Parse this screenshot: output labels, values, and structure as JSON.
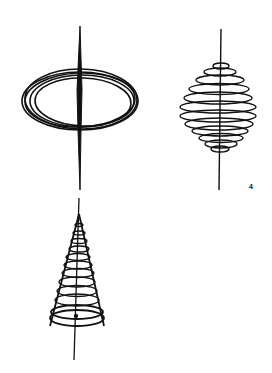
{
  "figure": {
    "label": "4",
    "ink_color": "#111111",
    "background": "#ffffff",
    "panels": [
      {
        "name": "ellipse-loops-with-spindle",
        "description": "Several overlapping elliptical loops crossed by a tapering vertical spindle"
      },
      {
        "name": "spiral-bulb-on-axis",
        "description": "Spherical coil of loops wound around a thin vertical axis"
      },
      {
        "name": "cone-spiral-on-axis",
        "description": "Conical spiral of diminishing loops around a vertical axis"
      }
    ]
  }
}
